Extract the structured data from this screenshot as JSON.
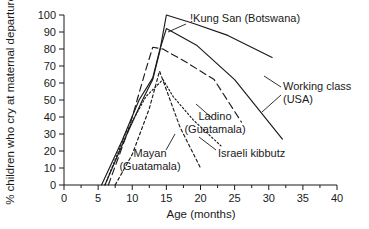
{
  "chart_data": {
    "type": "line",
    "title": "",
    "xlabel": "Age (months)",
    "ylabel": "% children who cry at maternal departure",
    "xlim": [
      0,
      40
    ],
    "ylim": [
      0,
      100
    ],
    "xticks": [
      0,
      5,
      10,
      15,
      20,
      25,
      30,
      35,
      40
    ],
    "xticklabels": [
      "0",
      "5",
      "10",
      "15",
      "20",
      "25",
      "30",
      "35",
      "40"
    ],
    "yticks": [
      0,
      10,
      20,
      30,
      40,
      50,
      60,
      70,
      80,
      90,
      100
    ],
    "yticklabels": [
      "0",
      "10",
      "20",
      "30",
      "40",
      "50",
      "60",
      "70",
      "80",
      "90",
      "100"
    ],
    "grid": false,
    "legend_position": "inline-annotations",
    "series": [
      {
        "name": "!Kung San (Botswana)",
        "style": "solid",
        "label_line1": "!Kung San (Botswana)",
        "label_line2": "",
        "x": [
          6.0,
          9.0,
          11.5,
          13.0,
          14.0,
          15.0,
          19.0,
          24.0,
          30.5
        ],
        "y": [
          0,
          28,
          50,
          62,
          78,
          100,
          95,
          88,
          75
        ]
      },
      {
        "name": "Working class (USA)",
        "style": "solid",
        "label_line1": "Working class",
        "label_line2": "(USA)",
        "x": [
          5.5,
          8.5,
          11.0,
          13.0,
          14.0,
          15.0,
          19.5,
          25.0,
          32.0
        ],
        "y": [
          0,
          26,
          50,
          63,
          79,
          92,
          82,
          62,
          27
        ]
      },
      {
        "name": "Ladino (Guatamala)",
        "style": "dashed",
        "label_line1": "Ladino",
        "label_line2": "(Guatamala)",
        "x": [
          6.5,
          9.5,
          12.0,
          13.0,
          14.5,
          18.0,
          22.0,
          26.0
        ],
        "y": [
          0,
          33,
          68,
          81,
          80,
          72,
          62,
          37
        ]
      },
      {
        "name": "Mayan (Guatamala)",
        "style": "dotted-dash",
        "label_line1": "Mayan",
        "label_line2": "(Guatamala)",
        "x": [
          7.5,
          10.0,
          12.5,
          14.0,
          15.0,
          17.0,
          20.0
        ],
        "y": [
          0,
          18,
          45,
          67,
          56,
          34,
          10
        ]
      },
      {
        "name": "Israeli kibbutz",
        "style": "dotted",
        "label_line1": "Israeli kibbutz",
        "label_line2": "",
        "x": [
          6.0,
          9.0,
          12.0,
          13.5,
          14.5,
          16.0,
          19.0,
          23.0
        ],
        "y": [
          0,
          30,
          52,
          58,
          62,
          52,
          38,
          23
        ]
      }
    ],
    "annotations": [
      {
        "id": "kung-san",
        "text_line1": "!Kung San (Botswana)",
        "text_line2": "",
        "x": 190,
        "y": 22
      },
      {
        "id": "working-class",
        "text_line1": "Working class",
        "text_line2": "(USA)",
        "x": 283,
        "y": 90
      },
      {
        "id": "ladino",
        "text_line1": "Ladino",
        "text_line2": "(Guatamala)",
        "x": 215,
        "y": 120
      },
      {
        "id": "israeli-kibbutz",
        "text_line1": "Israeli kibbutz",
        "text_line2": "",
        "x": 218,
        "y": 157
      },
      {
        "id": "mayan",
        "text_line1": "Mayan",
        "text_line2": "(Guatamala)",
        "x": 150,
        "y": 157
      }
    ]
  }
}
